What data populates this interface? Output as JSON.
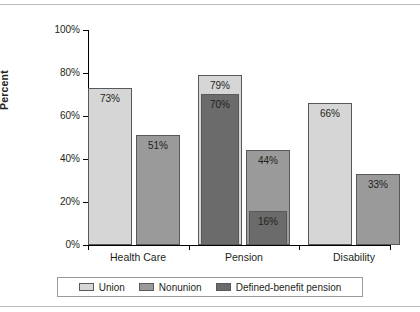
{
  "chart_data": {
    "type": "bar",
    "title": "",
    "xlabel": "",
    "ylabel": "Percent",
    "ylim": [
      0,
      100
    ],
    "ytick_labels": [
      "100%",
      "80%",
      "60%",
      "40%",
      "20%",
      "0%"
    ],
    "ytick_values": [
      100,
      80,
      60,
      40,
      20,
      0
    ],
    "grid": false,
    "legend_position": "bottom",
    "categories": [
      "Health Care",
      "Pension",
      "Disability"
    ],
    "series": [
      {
        "name": "Union",
        "color": "#d6d6d6",
        "values": [
          73,
          79,
          66
        ]
      },
      {
        "name": "Nonunion",
        "color": "#9a9a9a",
        "values": [
          51,
          44,
          33
        ]
      },
      {
        "name": "Defined-benefit pension",
        "color": "#6b6b6b",
        "values": [
          null,
          70,
          null
        ]
      },
      {
        "name": "Defined-benefit pension (nonunion)",
        "color": "#6b6b6b",
        "values": [
          null,
          16,
          null
        ]
      }
    ],
    "bars": [
      {
        "category": "Health Care",
        "series": "Union",
        "value": 73,
        "label": "73%",
        "color": "#d6d6d6",
        "x": 0,
        "width": 44,
        "overlay": false
      },
      {
        "category": "Health Care",
        "series": "Nonunion",
        "value": 51,
        "label": "51%",
        "color": "#9a9a9a",
        "x": 48,
        "width": 44,
        "overlay": false
      },
      {
        "category": "Pension",
        "series": "Union",
        "value": 79,
        "label": "79%",
        "color": "#d6d6d6",
        "x": 110,
        "width": 44,
        "overlay": false
      },
      {
        "category": "Pension",
        "series": "Defined-benefit pension",
        "value": 70,
        "label": "70%",
        "color": "#6b6b6b",
        "x": 113,
        "width": 38,
        "overlay": true
      },
      {
        "category": "Pension",
        "series": "Nonunion",
        "value": 44,
        "label": "44%",
        "color": "#9a9a9a",
        "x": 158,
        "width": 44,
        "overlay": false
      },
      {
        "category": "Pension",
        "series": "Defined-benefit pension",
        "value": 16,
        "label": "16%",
        "color": "#6b6b6b",
        "x": 161,
        "width": 38,
        "overlay": true
      },
      {
        "category": "Disability",
        "series": "Union",
        "value": 66,
        "label": "66%",
        "color": "#d6d6d6",
        "x": 220,
        "width": 44,
        "overlay": false
      },
      {
        "category": "Disability",
        "series": "Nonunion",
        "value": 33,
        "label": "33%",
        "color": "#9a9a9a",
        "x": 268,
        "width": 44,
        "overlay": false
      }
    ],
    "legend": [
      {
        "label": "Union",
        "color": "#d6d6d6"
      },
      {
        "label": "Nonunion",
        "color": "#9a9a9a"
      },
      {
        "label": "Defined-benefit pension",
        "color": "#6b6b6b"
      }
    ]
  }
}
